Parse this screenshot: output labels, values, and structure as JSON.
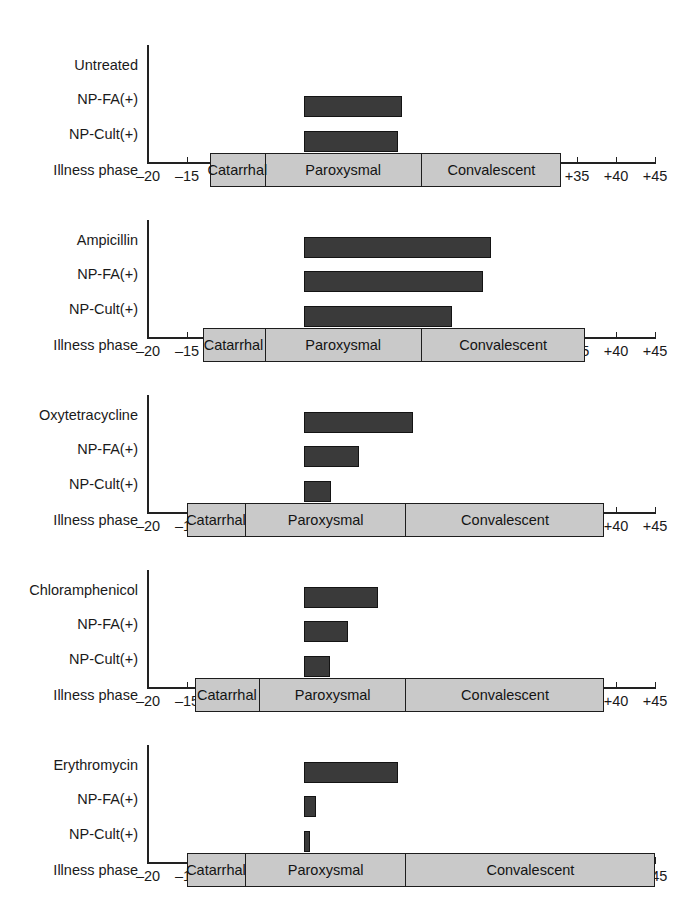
{
  "figure": {
    "axis": {
      "min": -20,
      "max": 45,
      "tick_step": 5,
      "tick_labels": [
        "–20",
        "–15",
        "–10",
        "–5",
        "0",
        "+5",
        "+10",
        "+15",
        "+20",
        "+25",
        "+30",
        "+35",
        "+40",
        "+45"
      ],
      "tick_values": [
        -20,
        -15,
        -10,
        -5,
        0,
        5,
        10,
        15,
        20,
        25,
        30,
        35,
        40,
        45
      ]
    },
    "row_labels": {
      "np_fa": "NP-FA(+)",
      "np_cult": "NP-Cult(+)",
      "illness_phase": "Illness phase"
    },
    "phase_labels": {
      "catarrhal": "Catarrhal",
      "paroxysmal": "Paroxysmal",
      "convalescent": "Convalescent"
    },
    "colors": {
      "bar_fill": "#3a3a3a",
      "bar_stroke": "#141414",
      "phase_fill": "#c9c9c9",
      "phase_stroke": "#1d1d1d",
      "axis": "#222222",
      "text": "#1a1a1a"
    }
  },
  "chart_data": {
    "type": "bar",
    "title": "",
    "xlabel": "",
    "ylabel": "",
    "xlim": [
      -20,
      45
    ],
    "grid": false,
    "legend": "none",
    "orientation": "horizontal",
    "note": "Horizontal range bars: duration of nasopharyngeal positivity and illness phases relative to day 0 (start of therapy), in days. Five treatment panels.",
    "panels": [
      {
        "treatment": "Untreated",
        "rows": [
          {
            "label": "Untreated",
            "start": null,
            "end": null
          },
          {
            "label": "NP-FA(+)",
            "start": 0,
            "end": 12.5
          },
          {
            "label": "NP-Cult(+)",
            "start": 0,
            "end": 12.0
          }
        ],
        "illness_phase": {
          "start": -12.0,
          "end": 33.0,
          "segments": [
            {
              "name": "Catarrhal",
              "start": -12.0,
              "end": -5.0
            },
            {
              "name": "Paroxysmal",
              "start": -5.0,
              "end": 15.0
            },
            {
              "name": "Convalescent",
              "start": 15.0,
              "end": 33.0
            }
          ]
        }
      },
      {
        "treatment": "Ampicillin",
        "rows": [
          {
            "label": "Ampicillin",
            "start": 0,
            "end": 24.0
          },
          {
            "label": "NP-FA(+)",
            "start": 0,
            "end": 23.0
          },
          {
            "label": "NP-Cult(+)",
            "start": 0,
            "end": 19.0
          }
        ],
        "illness_phase": {
          "start": -13.0,
          "end": 36.0,
          "segments": [
            {
              "name": "Catarrhal",
              "start": -13.0,
              "end": -5.0
            },
            {
              "name": "Paroxysmal",
              "start": -5.0,
              "end": 15.0
            },
            {
              "name": "Convalescent",
              "start": 15.0,
              "end": 36.0
            }
          ]
        }
      },
      {
        "treatment": "Oxytetracycline",
        "rows": [
          {
            "label": "Oxytetracycline",
            "start": 0,
            "end": 14.0
          },
          {
            "label": "NP-FA(+)",
            "start": 0,
            "end": 7.0
          },
          {
            "label": "NP-Cult(+)",
            "start": 0,
            "end": 3.5
          }
        ],
        "illness_phase": {
          "start": -15.0,
          "end": 38.5,
          "segments": [
            {
              "name": "Catarrhal",
              "start": -15.0,
              "end": -7.5
            },
            {
              "name": "Paroxysmal",
              "start": -7.5,
              "end": 13.0
            },
            {
              "name": "Convalescent",
              "start": 13.0,
              "end": 38.5
            }
          ]
        }
      },
      {
        "treatment": "Chloramphenicol",
        "rows": [
          {
            "label": "Chloramphenicol",
            "start": 0,
            "end": 9.5
          },
          {
            "label": "NP-FA(+)",
            "start": 0,
            "end": 5.7
          },
          {
            "label": "NP-Cult(+)",
            "start": 0,
            "end": 3.3
          }
        ],
        "illness_phase": {
          "start": -14.0,
          "end": 38.5,
          "segments": [
            {
              "name": "Catarrhal",
              "start": -14.0,
              "end": -5.7
            },
            {
              "name": "Paroxysmal",
              "start": -5.7,
              "end": 13.0
            },
            {
              "name": "Convalescent",
              "start": 13.0,
              "end": 38.5
            }
          ]
        }
      },
      {
        "treatment": "Erythromycin",
        "rows": [
          {
            "label": "Erythromycin",
            "start": 0,
            "end": 12.0
          },
          {
            "label": "NP-FA(+)",
            "start": 0,
            "end": 1.5
          },
          {
            "label": "NP-Cult(+)",
            "start": 0,
            "end": 0.8
          }
        ],
        "illness_phase": {
          "start": -15.0,
          "end": 45.0,
          "segments": [
            {
              "name": "Catarrhal",
              "start": -15.0,
              "end": -7.5
            },
            {
              "name": "Paroxysmal",
              "start": -7.5,
              "end": 13.0
            },
            {
              "name": "Convalescent",
              "start": 13.0,
              "end": 45.0
            }
          ]
        }
      }
    ]
  }
}
